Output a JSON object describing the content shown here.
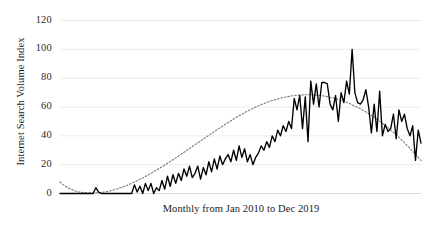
{
  "chart_data": {
    "type": "line",
    "title": "",
    "xlabel": "Monthly from Jan 2010 to Dec 2019",
    "ylabel": "Internet Search Volume Index",
    "ylim": [
      0,
      120
    ],
    "yticks": [
      0,
      20,
      40,
      60,
      80,
      100,
      120
    ],
    "ytick_labels": [
      "0",
      "20",
      "40",
      "60",
      "80",
      "100",
      "120"
    ],
    "grid": "horizontal",
    "legend": "none",
    "x_start": "Jan 2010",
    "x_end": "Dec 2019",
    "x_count": 120,
    "series": [
      {
        "name": "Internet Search Volume Index",
        "style": "solid",
        "color": "#000000",
        "values": [
          0,
          0,
          0,
          0,
          0,
          0,
          0,
          0,
          0,
          0,
          0,
          0,
          0,
          4,
          1,
          0,
          0,
          0,
          0,
          0,
          0,
          0,
          0,
          0,
          0,
          0,
          0,
          6,
          1,
          5,
          0,
          7,
          2,
          7,
          0,
          4,
          2,
          9,
          3,
          12,
          5,
          13,
          7,
          14,
          9,
          17,
          12,
          19,
          11,
          14,
          19,
          10,
          18,
          13,
          22,
          15,
          24,
          17,
          26,
          20,
          24,
          27,
          22,
          30,
          23,
          33,
          25,
          31,
          22,
          27,
          20,
          25,
          28,
          33,
          30,
          36,
          32,
          40,
          36,
          44,
          40,
          47,
          43,
          50,
          45,
          66,
          58,
          68,
          45,
          67,
          36,
          78,
          62,
          76,
          60,
          77,
          77,
          76,
          62,
          58,
          68,
          50,
          70,
          63,
          78,
          69,
          100,
          70,
          63,
          62,
          65,
          72,
          60,
          42,
          62,
          43,
          71,
          40,
          48,
          43,
          45,
          55,
          38,
          58,
          50,
          55,
          45,
          40,
          47,
          23,
          44,
          35
        ]
      },
      {
        "name": "Polynomial trend",
        "style": "dotted",
        "color": "#7a7a7a",
        "values": [
          8,
          6,
          4.5,
          3.2,
          2.2,
          1.5,
          1.0,
          0.7,
          0.5,
          0.4,
          0.4,
          0.5,
          0.7,
          1.0,
          1.4,
          1.9,
          2.5,
          3.2,
          4.0,
          4.9,
          5.8,
          6.8,
          7.9,
          9.0,
          10.2,
          11.4,
          12.7,
          14.0,
          15.4,
          16.8,
          18.2,
          19.7,
          21.2,
          22.7,
          24.2,
          25.8,
          27.4,
          29.0,
          30.6,
          32.2,
          33.8,
          35.4,
          37.0,
          38.6,
          40.2,
          41.8,
          43.4,
          45.0,
          46.5,
          48.0,
          49.5,
          51.0,
          52.4,
          53.8,
          55.1,
          56.4,
          57.6,
          58.8,
          59.9,
          61.0,
          62.0,
          62.9,
          63.8,
          64.6,
          65.3,
          65.9,
          66.5,
          67.0,
          67.4,
          67.8,
          68.1,
          68.3,
          68.4,
          68.5,
          68.5,
          68.4,
          68.2,
          68.0,
          67.7,
          67.3,
          66.8,
          66.2,
          65.6,
          64.9,
          64.1,
          63.2,
          62.2,
          61.1,
          60.0,
          58.8,
          57.5,
          56.1,
          54.6,
          53.0,
          51.4,
          49.7,
          47.9,
          46.0,
          44.0,
          42.0,
          39.9,
          37.7,
          35.4,
          33.0,
          30.6,
          28.1,
          25.5,
          22.8
        ]
      }
    ],
    "annotations": [
      {
        "label": "peak",
        "value": 100
      }
    ]
  },
  "axes": {
    "y_title": "Internet Search Volume Index",
    "x_title": "Monthly from Jan 2010 to Dec 2019"
  }
}
